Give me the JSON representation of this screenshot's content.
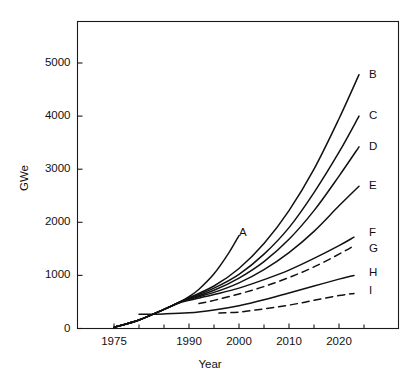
{
  "chart_data": {
    "type": "line",
    "title": "",
    "xlabel": "Year",
    "ylabel": "GWe",
    "xlim": [
      1970,
      2030
    ],
    "ylim": [
      0,
      5600
    ],
    "grid": false,
    "legend_position": "right-endpoint-labels",
    "xticks": [
      1975,
      1990,
      2000,
      2010,
      2020
    ],
    "xtick_labels": [
      "1975",
      "1990",
      "2000",
      "2010",
      "2020"
    ],
    "yticks": [
      0,
      1000,
      2000,
      3000,
      4000,
      5000
    ],
    "ytick_labels": [
      "0",
      "1000",
      "2000",
      "3000",
      "4000",
      "5000"
    ],
    "series": [
      {
        "name": "A",
        "label": "A",
        "style": "solid",
        "label_x": 2000,
        "label_y": 1800,
        "x": [
          1975,
          1980,
          1985,
          1988,
          1990,
          1992,
          1995,
          1998,
          2000
        ],
        "y": [
          20,
          160,
          360,
          490,
          600,
          740,
          1030,
          1430,
          1750
        ]
      },
      {
        "name": "B",
        "label": "B",
        "style": "solid",
        "label_x": 2026,
        "label_y": 4780,
        "x": [
          1975,
          1980,
          1985,
          1988,
          1990,
          1995,
          2000,
          2005,
          2010,
          2015,
          2020,
          2024
        ],
        "y": [
          20,
          160,
          360,
          490,
          580,
          800,
          1130,
          1600,
          2220,
          3000,
          3950,
          4780
        ]
      },
      {
        "name": "C",
        "label": "C",
        "style": "solid",
        "label_x": 2026,
        "label_y": 4000,
        "x": [
          1975,
          1980,
          1985,
          1988,
          1990,
          1995,
          2000,
          2005,
          2010,
          2015,
          2020,
          2024
        ],
        "y": [
          20,
          160,
          360,
          490,
          570,
          760,
          1020,
          1400,
          1900,
          2560,
          3320,
          4000
        ]
      },
      {
        "name": "D",
        "label": "D",
        "style": "solid",
        "label_x": 2026,
        "label_y": 3420,
        "x": [
          1975,
          1980,
          1985,
          1988,
          1990,
          1995,
          2000,
          2005,
          2010,
          2015,
          2020,
          2024
        ],
        "y": [
          20,
          160,
          360,
          490,
          560,
          720,
          950,
          1260,
          1680,
          2220,
          2870,
          3420
        ]
      },
      {
        "name": "E",
        "label": "E",
        "style": "solid",
        "label_x": 2026,
        "label_y": 2680,
        "x": [
          1975,
          1980,
          1985,
          1988,
          1990,
          1995,
          2000,
          2005,
          2010,
          2015,
          2020,
          2024
        ],
        "y": [
          20,
          160,
          360,
          490,
          550,
          680,
          860,
          1110,
          1430,
          1830,
          2310,
          2680
        ]
      },
      {
        "name": "F",
        "label": "F",
        "style": "solid",
        "label_x": 2026,
        "label_y": 1800,
        "x": [
          1975,
          1980,
          1985,
          1988,
          1990,
          1995,
          2000,
          2005,
          2010,
          2015,
          2020,
          2023
        ],
        "y": [
          20,
          160,
          360,
          480,
          530,
          640,
          760,
          920,
          1100,
          1320,
          1560,
          1720
        ]
      },
      {
        "name": "G",
        "label": "G",
        "style": "dashed",
        "label_x": 2026,
        "label_y": 1490,
        "x": [
          1992,
          1995,
          2000,
          2005,
          2010,
          2015,
          2020,
          2023
        ],
        "y": [
          470,
          530,
          650,
          790,
          960,
          1160,
          1400,
          1560
        ]
      },
      {
        "name": "H",
        "label": "H",
        "style": "solid",
        "label_x": 2026,
        "label_y": 1050,
        "x": [
          1980,
          1985,
          1990,
          1995,
          2000,
          2005,
          2010,
          2015,
          2020,
          2023
        ],
        "y": [
          270,
          275,
          295,
          350,
          430,
          540,
          670,
          800,
          930,
          1000
        ]
      },
      {
        "name": "I",
        "label": "I",
        "style": "dashed",
        "label_x": 2026,
        "label_y": 700,
        "x": [
          1996,
          2000,
          2005,
          2010,
          2015,
          2020,
          2023
        ],
        "y": [
          290,
          310,
          370,
          440,
          530,
          620,
          660
        ]
      }
    ]
  }
}
